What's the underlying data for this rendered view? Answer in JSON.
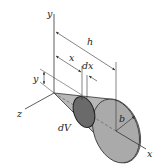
{
  "diagram": {
    "labels": {
      "y_axis": "y",
      "z_axis": "z",
      "x_axis": "x",
      "height": "h",
      "x_dist": "x",
      "dx": "dx",
      "y_dim": "y",
      "volume_element": "dV",
      "radius": "b"
    },
    "colors": {
      "line": "#333333",
      "cone_fill": "#b8b8b8",
      "base_fill": "#aaaaaa",
      "disk_fill": "#6a6a6a",
      "background": "#ffffff"
    }
  }
}
